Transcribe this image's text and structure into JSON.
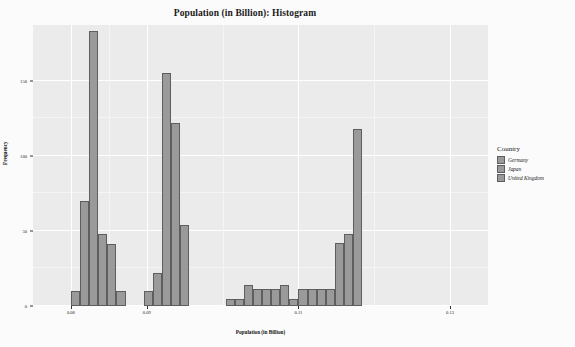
{
  "chart_data": {
    "type": "bar",
    "title": "Population (in Billion): Histogram",
    "xlabel": "Population (in Billion)",
    "ylabel": "Frequency",
    "grid": true,
    "legend_position": "right",
    "xlim": [
      0.075,
      0.135
    ],
    "ylim": [
      0,
      187
    ],
    "ytick_values": [
      0,
      50,
      100,
      150
    ],
    "ytick_labels": [
      "0",
      "50",
      "100",
      "150"
    ],
    "xtick_values": [
      0.08,
      0.09,
      0.11,
      0.13
    ],
    "xtick_labels": [
      "0.08",
      "0.09",
      "0.11",
      "0.13"
    ],
    "legend_title": "Country",
    "legend_entries": [
      "Germany",
      "Japan",
      "United Kingdom"
    ],
    "bar_color": "#9a9a9a",
    "bar_edge_color": "#5e5e5e",
    "panel_color": "#ebebeb",
    "gridline_color": "#ffffff",
    "bins": [
      {
        "x0": 0.08,
        "x1": 0.0812,
        "value": 10
      },
      {
        "x0": 0.0812,
        "x1": 0.0824,
        "value": 70
      },
      {
        "x0": 0.0824,
        "x1": 0.0836,
        "value": 183
      },
      {
        "x0": 0.0836,
        "x1": 0.0848,
        "value": 48
      },
      {
        "x0": 0.0848,
        "x1": 0.086,
        "value": 41
      },
      {
        "x0": 0.086,
        "x1": 0.0872,
        "value": 10
      },
      {
        "x0": 0.0896,
        "x1": 0.0908,
        "value": 10
      },
      {
        "x0": 0.0908,
        "x1": 0.092,
        "value": 22
      },
      {
        "x0": 0.092,
        "x1": 0.0932,
        "value": 155
      },
      {
        "x0": 0.0932,
        "x1": 0.0944,
        "value": 122
      },
      {
        "x0": 0.0944,
        "x1": 0.0956,
        "value": 54
      },
      {
        "x0": 0.1004,
        "x1": 0.1016,
        "value": 5
      },
      {
        "x0": 0.1016,
        "x1": 0.1028,
        "value": 5
      },
      {
        "x0": 0.1028,
        "x1": 0.104,
        "value": 14
      },
      {
        "x0": 0.104,
        "x1": 0.1052,
        "value": 11
      },
      {
        "x0": 0.1052,
        "x1": 0.1064,
        "value": 11
      },
      {
        "x0": 0.1064,
        "x1": 0.1076,
        "value": 11
      },
      {
        "x0": 0.1076,
        "x1": 0.1088,
        "value": 14
      },
      {
        "x0": 0.1088,
        "x1": 0.11,
        "value": 5
      },
      {
        "x0": 0.11,
        "x1": 0.1112,
        "value": 11
      },
      {
        "x0": 0.1112,
        "x1": 0.1124,
        "value": 11
      },
      {
        "x0": 0.1124,
        "x1": 0.1136,
        "value": 11
      },
      {
        "x0": 0.1136,
        "x1": 0.1148,
        "value": 11
      },
      {
        "x0": 0.1148,
        "x1": 0.116,
        "value": 42
      },
      {
        "x0": 0.116,
        "x1": 0.1172,
        "value": 48
      },
      {
        "x0": 0.1172,
        "x1": 0.1184,
        "value": 118
      }
    ]
  }
}
